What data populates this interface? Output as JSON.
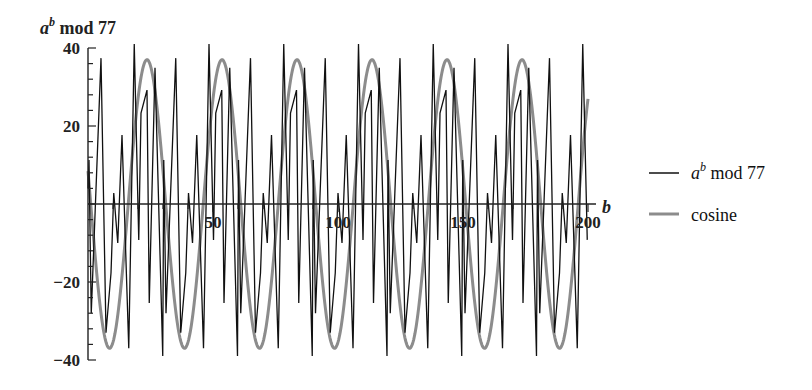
{
  "chart_data": {
    "type": "line",
    "title": "",
    "xlabel": "b",
    "ylabel_base": "a",
    "ylabel_sup": "b",
    "ylabel_rest": " mod 77",
    "xlim": [
      0,
      200
    ],
    "ylim": [
      -40,
      40
    ],
    "x_ticks": [
      50,
      100,
      150,
      200
    ],
    "y_ticks": [
      -40,
      -20,
      20,
      40
    ],
    "y_minor_step": 4,
    "x_minor_step": 10,
    "grid": false,
    "legend_position": "right",
    "series": [
      {
        "name": "a^b mod 77",
        "label_base": "a",
        "label_sup": "b",
        "label_rest": " mod 77",
        "color": "#111111",
        "period": 29.9,
        "period_vertices_b": [
          0.0,
          0.4,
          1.3,
          5.2,
          7.2,
          9.2,
          10.3,
          11.9,
          13.6,
          16.3,
          18.5,
          20.3,
          21.2,
          23.6,
          24.5,
          26.8,
          29.9
        ],
        "period_vertices_y": [
          4,
          11.3,
          -28,
          37.4,
          -33,
          -17.7,
          2.8,
          -10,
          17.7,
          -37,
          41,
          -9.2,
          23.3,
          29.2,
          -25.4,
          34.9,
          -39
        ]
      },
      {
        "name": "cosine",
        "label": "cosine",
        "color": "#8c8c8c",
        "amplitude": 37,
        "period": 30,
        "peak_at_b": 23.6
      }
    ]
  }
}
